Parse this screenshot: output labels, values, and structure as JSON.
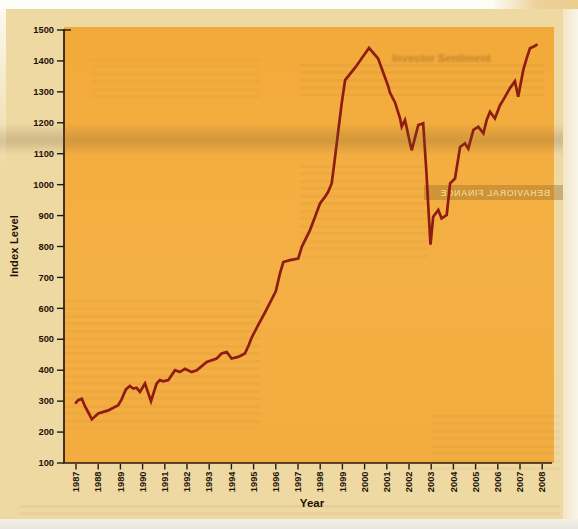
{
  "page": {
    "bleed_heading": "Investor Sentiment",
    "bleed_band_text": "BEHAVIORAL FINANCE"
  },
  "chart_data": {
    "type": "line",
    "title": "",
    "xlabel": "Year",
    "ylabel": "Index Level",
    "xlim": [
      1987,
      2008.4
    ],
    "ylim": [
      100,
      1500
    ],
    "grid": false,
    "legend": "none",
    "background_color": "#f3ac3f",
    "page_color": "#efd9a2",
    "axis_color": "#241a0c",
    "y_ticks": [
      100,
      200,
      300,
      400,
      500,
      600,
      700,
      800,
      900,
      1000,
      1100,
      1200,
      1300,
      1400,
      1500
    ],
    "x_tick_labels": [
      "1987",
      "1988",
      "1989",
      "1990",
      "1991",
      "1992",
      "1993",
      "1994",
      "1995",
      "1996",
      "1997",
      "1998",
      "1999",
      "2000",
      "2001",
      "2002",
      "2003",
      "2004",
      "2005",
      "2006",
      "2007",
      "2008"
    ],
    "series": [
      {
        "name": "Index Level",
        "color": "#8e1c12",
        "points": [
          [
            1987.0,
            295
          ],
          [
            1987.1,
            303
          ],
          [
            1987.26,
            308
          ],
          [
            1987.42,
            281
          ],
          [
            1987.58,
            260
          ],
          [
            1987.71,
            241
          ],
          [
            1988.0,
            260
          ],
          [
            1988.45,
            270
          ],
          [
            1988.9,
            287
          ],
          [
            1989.05,
            305
          ],
          [
            1989.25,
            338
          ],
          [
            1989.43,
            349
          ],
          [
            1989.58,
            341
          ],
          [
            1989.73,
            343
          ],
          [
            1989.88,
            330
          ],
          [
            1990.11,
            357
          ],
          [
            1990.38,
            300
          ],
          [
            1990.63,
            357
          ],
          [
            1990.78,
            368
          ],
          [
            1990.93,
            364
          ],
          [
            1991.16,
            368
          ],
          [
            1991.46,
            400
          ],
          [
            1991.68,
            394
          ],
          [
            1991.91,
            405
          ],
          [
            1992.21,
            394
          ],
          [
            1992.44,
            400
          ],
          [
            1992.89,
            427
          ],
          [
            1993.34,
            438
          ],
          [
            1993.56,
            454
          ],
          [
            1993.79,
            459
          ],
          [
            1994.01,
            438
          ],
          [
            1994.31,
            443
          ],
          [
            1994.61,
            454
          ],
          [
            1994.78,
            481
          ],
          [
            1994.91,
            505
          ],
          [
            1995.2,
            545
          ],
          [
            1995.5,
            585
          ],
          [
            1995.75,
            620
          ],
          [
            1996.0,
            655
          ],
          [
            1996.19,
            713
          ],
          [
            1996.34,
            750
          ],
          [
            1996.64,
            756
          ],
          [
            1997.01,
            761
          ],
          [
            1997.17,
            799
          ],
          [
            1997.54,
            853
          ],
          [
            1997.77,
            896
          ],
          [
            1997.99,
            939
          ],
          [
            1998.22,
            961
          ],
          [
            1998.36,
            977
          ],
          [
            1998.52,
            1004
          ],
          [
            1998.67,
            1090
          ],
          [
            1998.82,
            1177
          ],
          [
            1998.97,
            1263
          ],
          [
            1999.12,
            1338
          ],
          [
            1999.58,
            1379
          ],
          [
            1999.95,
            1417
          ],
          [
            2000.2,
            1442
          ],
          [
            2000.61,
            1408
          ],
          [
            2001.07,
            1316
          ],
          [
            2001.14,
            1298
          ],
          [
            2001.37,
            1266
          ],
          [
            2001.6,
            1214
          ],
          [
            2001.67,
            1187
          ],
          [
            2001.82,
            1209
          ],
          [
            2002.05,
            1133
          ],
          [
            2002.12,
            1111
          ],
          [
            2002.42,
            1193
          ],
          [
            2002.64,
            1198
          ],
          [
            2002.79,
            1036
          ],
          [
            2002.87,
            928
          ],
          [
            2002.97,
            806
          ],
          [
            2003.09,
            896
          ],
          [
            2003.32,
            918
          ],
          [
            2003.47,
            891
          ],
          [
            2003.7,
            902
          ],
          [
            2003.85,
            1004
          ],
          [
            2004.07,
            1020
          ],
          [
            2004.3,
            1122
          ],
          [
            2004.52,
            1133
          ],
          [
            2004.67,
            1117
          ],
          [
            2004.9,
            1177
          ],
          [
            2005.12,
            1187
          ],
          [
            2005.35,
            1166
          ],
          [
            2005.5,
            1209
          ],
          [
            2005.65,
            1236
          ],
          [
            2005.87,
            1214
          ],
          [
            2006.1,
            1257
          ],
          [
            2006.25,
            1274
          ],
          [
            2006.55,
            1312
          ],
          [
            2006.77,
            1334
          ],
          [
            2006.92,
            1284
          ],
          [
            2007.15,
            1371
          ],
          [
            2007.3,
            1409
          ],
          [
            2007.45,
            1441
          ],
          [
            2007.6,
            1446
          ],
          [
            2007.75,
            1452
          ]
        ]
      }
    ]
  }
}
